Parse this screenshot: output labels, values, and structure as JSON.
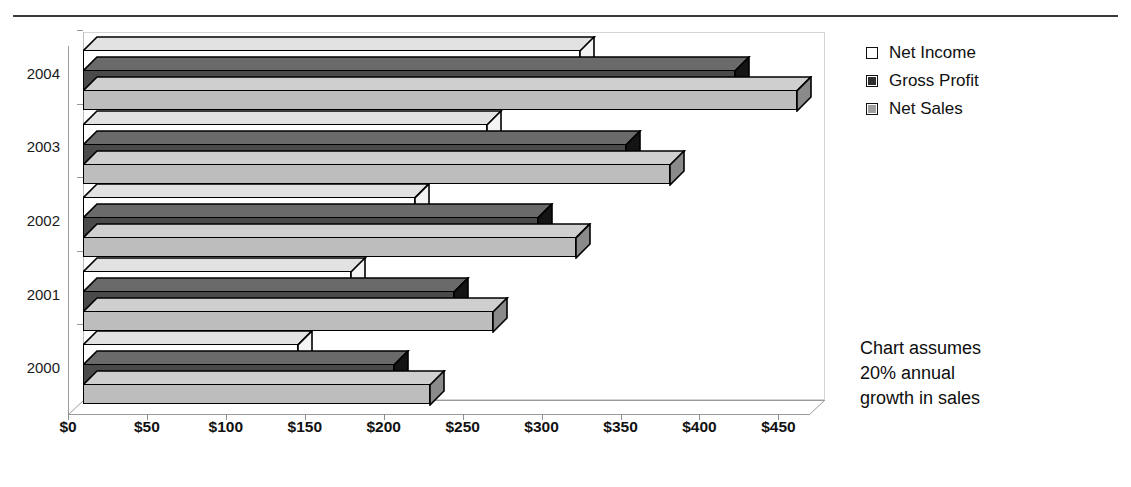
{
  "header": {
    "clipped_top_text": "",
    "divider": true
  },
  "legend": {
    "position": "top-right",
    "items": [
      {
        "label": "Net Income",
        "swatch": "net-income",
        "color": "#ffffff"
      },
      {
        "label": "Gross Profit",
        "swatch": "gross-profit",
        "color": "#2e2e2e"
      },
      {
        "label": "Net Sales",
        "swatch": "net-sales",
        "color": "#9e9e9e"
      }
    ]
  },
  "annotation": {
    "line1": "Chart assumes",
    "line2": "20% annual",
    "line3": "growth in sales"
  },
  "axis": {
    "x_ticks": [
      "$0",
      "$50",
      "$100",
      "$150",
      "$200",
      "$250",
      "$300",
      "$350",
      "$400",
      "$450"
    ],
    "y_ticks": [
      "2000",
      "2001",
      "2002",
      "2003",
      "2004"
    ]
  },
  "chart_data": {
    "type": "bar",
    "orientation": "horizontal",
    "style": "3d-clustered-bar",
    "title": "",
    "xlabel": "",
    "ylabel": "",
    "xlim": [
      0,
      450
    ],
    "grid": false,
    "legend_position": "top-right",
    "categories": [
      "2000",
      "2001",
      "2002",
      "2003",
      "2004"
    ],
    "series": [
      {
        "name": "Net Income",
        "values": [
          136,
          170,
          210,
          256,
          315
        ]
      },
      {
        "name": "Gross Profit",
        "values": [
          197,
          235,
          288,
          344,
          413
        ]
      },
      {
        "name": "Net Sales",
        "values": [
          220,
          260,
          312,
          372,
          452
        ]
      }
    ],
    "annotations": [
      "Chart assumes 20% annual growth in sales"
    ],
    "axis_tick_labels_x": [
      "$0",
      "$50",
      "$100",
      "$150",
      "$200",
      "$250",
      "$300",
      "$350",
      "$400",
      "$450"
    ],
    "axis_tick_labels_y": [
      "2000",
      "2001",
      "2002",
      "2003",
      "2004"
    ],
    "units": "dollars (millions)"
  }
}
